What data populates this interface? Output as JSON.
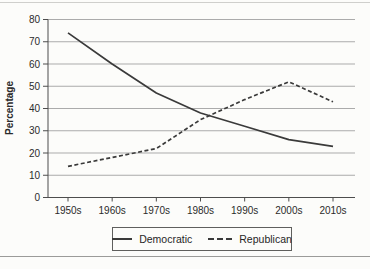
{
  "chart_data": {
    "type": "line",
    "title": "",
    "categories": [
      "1950s",
      "1960s",
      "1970s",
      "1980s",
      "1990s",
      "2000s",
      "2010s"
    ],
    "series": [
      {
        "name": "Democratic",
        "line_style": "solid",
        "values": [
          74,
          60,
          47,
          38,
          32,
          26,
          23
        ]
      },
      {
        "name": "Republican",
        "line_style": "dashed",
        "values": [
          14,
          18,
          22,
          35,
          44,
          52,
          43
        ]
      }
    ],
    "xlabel": "",
    "ylabel": "Percentage",
    "ylim": [
      0,
      80
    ],
    "yticks": [
      0,
      10,
      20,
      30,
      40,
      50,
      60,
      70,
      80
    ],
    "grid": "horizontal",
    "legend_position": "bottom-center",
    "legend_entries": [
      "Democratic",
      "Republican"
    ],
    "colors": {
      "line": "#3a3a3a",
      "grid": "#ababab",
      "axis": "#4d4d4d",
      "text": "#2b2b2b",
      "background": "#fcfcfa"
    }
  }
}
